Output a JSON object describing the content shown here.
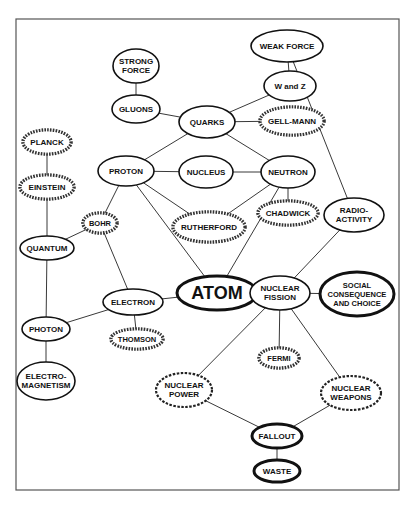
{
  "diagram": {
    "type": "concept-map",
    "central_concept": "ATOM",
    "frame": {
      "x": 16,
      "y": 19,
      "width": 383,
      "height": 471
    },
    "nodes": [
      {
        "id": "strong_force",
        "lines": [
          "STRONG",
          "FORCE"
        ],
        "cx": 136,
        "cy": 66,
        "rx": 23,
        "ry": 17,
        "style": "plain",
        "size": 8
      },
      {
        "id": "gluons",
        "lines": [
          "GLUONS"
        ],
        "cx": 136,
        "cy": 109,
        "rx": 24,
        "ry": 14,
        "style": "plain",
        "size": 8
      },
      {
        "id": "quarks",
        "lines": [
          "QUARKS"
        ],
        "cx": 207,
        "cy": 122,
        "rx": 28,
        "ry": 16,
        "style": "plain",
        "size": 8
      },
      {
        "id": "weak_force",
        "lines": [
          "WEAK FORCE"
        ],
        "cx": 287,
        "cy": 46,
        "rx": 36,
        "ry": 16,
        "style": "plain",
        "size": 8
      },
      {
        "id": "w_and_z",
        "lines": [
          "W and Z"
        ],
        "cx": 290,
        "cy": 86,
        "rx": 26,
        "ry": 15,
        "style": "plain",
        "size": 8
      },
      {
        "id": "gell_mann",
        "lines": [
          "GELL-MANN"
        ],
        "cx": 292,
        "cy": 121,
        "rx": 32,
        "ry": 14,
        "style": "striped",
        "size": 8
      },
      {
        "id": "planck",
        "lines": [
          "PLANCK"
        ],
        "cx": 47,
        "cy": 142,
        "rx": 24,
        "ry": 12,
        "style": "striped",
        "size": 8
      },
      {
        "id": "proton",
        "lines": [
          "PROTON"
        ],
        "cx": 126,
        "cy": 171,
        "rx": 28,
        "ry": 15,
        "style": "plain",
        "size": 8
      },
      {
        "id": "nucleus",
        "lines": [
          "NUCLEUS"
        ],
        "cx": 206,
        "cy": 172,
        "rx": 27,
        "ry": 16,
        "style": "plain",
        "size": 8
      },
      {
        "id": "neutron",
        "lines": [
          "NEUTRON"
        ],
        "cx": 288,
        "cy": 172,
        "rx": 27,
        "ry": 16,
        "style": "plain",
        "size": 8
      },
      {
        "id": "einstein",
        "lines": [
          "EINSTEIN"
        ],
        "cx": 47,
        "cy": 187,
        "rx": 27,
        "ry": 12,
        "style": "striped",
        "size": 8
      },
      {
        "id": "rutherford",
        "lines": [
          "RUTHERFORD"
        ],
        "cx": 209,
        "cy": 227,
        "rx": 36,
        "ry": 15,
        "style": "striped",
        "size": 8
      },
      {
        "id": "chadwick",
        "lines": [
          "CHADWICK"
        ],
        "cx": 288,
        "cy": 213,
        "rx": 30,
        "ry": 12,
        "style": "striped",
        "size": 8
      },
      {
        "id": "radioactivity",
        "lines": [
          "RADIO-",
          "ACTIVITY"
        ],
        "cx": 354,
        "cy": 215,
        "rx": 30,
        "ry": 17,
        "style": "plain",
        "size": 8
      },
      {
        "id": "bohr",
        "lines": [
          "BOHR"
        ],
        "cx": 100,
        "cy": 223,
        "rx": 17,
        "ry": 10,
        "style": "striped",
        "size": 7.5
      },
      {
        "id": "quantum",
        "lines": [
          "QUANTUM"
        ],
        "cx": 47,
        "cy": 248,
        "rx": 27,
        "ry": 12,
        "style": "plain",
        "size": 8
      },
      {
        "id": "atom",
        "lines": [
          "ATOM"
        ],
        "cx": 217,
        "cy": 293,
        "rx": 40,
        "ry": 17,
        "style": "bold",
        "size": 18
      },
      {
        "id": "nuclear_fission",
        "lines": [
          "NUCLEAR",
          "FISSION"
        ],
        "cx": 280,
        "cy": 293,
        "rx": 30,
        "ry": 17,
        "style": "plain",
        "size": 8
      },
      {
        "id": "social",
        "lines": [
          "SOCIAL",
          "CONSEQUENCE",
          "AND CHOICE"
        ],
        "cx": 357,
        "cy": 294,
        "rx": 37,
        "ry": 22,
        "style": "bold",
        "size": 7.5
      },
      {
        "id": "electron",
        "lines": [
          "ELECTRON"
        ],
        "cx": 133,
        "cy": 302,
        "rx": 30,
        "ry": 13,
        "style": "plain",
        "size": 8
      },
      {
        "id": "photon",
        "lines": [
          "PHOTON"
        ],
        "cx": 46,
        "cy": 329,
        "rx": 24,
        "ry": 12,
        "style": "plain",
        "size": 8
      },
      {
        "id": "thomson",
        "lines": [
          "THOMSON"
        ],
        "cx": 137,
        "cy": 339,
        "rx": 26,
        "ry": 10,
        "style": "striped",
        "size": 7.5
      },
      {
        "id": "fermi",
        "lines": [
          "FERMI"
        ],
        "cx": 279,
        "cy": 358,
        "rx": 20,
        "ry": 10,
        "style": "striped",
        "size": 7.5
      },
      {
        "id": "electromagnetism",
        "lines": [
          "ELECTRO-",
          "MAGNETISM"
        ],
        "cx": 46,
        "cy": 381,
        "rx": 29,
        "ry": 19,
        "style": "plain",
        "size": 8
      },
      {
        "id": "nuclear_power",
        "lines": [
          "NUCLEAR",
          "POWER"
        ],
        "cx": 184,
        "cy": 390,
        "rx": 28,
        "ry": 17,
        "style": "dashed",
        "size": 8
      },
      {
        "id": "nuclear_weapons",
        "lines": [
          "NUCLEAR",
          "WEAPONS"
        ],
        "cx": 351,
        "cy": 393,
        "rx": 30,
        "ry": 17,
        "style": "dashed",
        "size": 8
      },
      {
        "id": "fallout",
        "lines": [
          "FALLOUT"
        ],
        "cx": 277,
        "cy": 436,
        "rx": 25,
        "ry": 12,
        "style": "bold",
        "size": 8
      },
      {
        "id": "waste",
        "lines": [
          "WASTE"
        ],
        "cx": 277,
        "cy": 471,
        "rx": 23,
        "ry": 11,
        "style": "bold",
        "size": 8
      }
    ],
    "edges": [
      [
        "strong_force",
        "gluons"
      ],
      [
        "gluons",
        "quarks"
      ],
      [
        "quarks",
        "w_and_z"
      ],
      [
        "quarks",
        "gell_mann"
      ],
      [
        "quarks",
        "proton"
      ],
      [
        "quarks",
        "neutron"
      ],
      [
        "weak_force",
        "w_and_z"
      ],
      [
        "weak_force",
        "radioactivity"
      ],
      [
        "planck",
        "einstein"
      ],
      [
        "einstein",
        "quantum"
      ],
      [
        "quantum",
        "photon"
      ],
      [
        "quantum",
        "bohr"
      ],
      [
        "photon",
        "electromagnetism"
      ],
      [
        "photon",
        "electron"
      ],
      [
        "proton",
        "nucleus"
      ],
      [
        "nucleus",
        "neutron"
      ],
      [
        "proton",
        "rutherford"
      ],
      [
        "neutron",
        "rutherford"
      ],
      [
        "neutron",
        "chadwick"
      ],
      [
        "proton",
        "bohr"
      ],
      [
        "proton",
        "atom"
      ],
      [
        "neutron",
        "atom"
      ],
      [
        "bohr",
        "electron"
      ],
      [
        "electron",
        "atom"
      ],
      [
        "electron",
        "thomson"
      ],
      [
        "atom",
        "nuclear_fission"
      ],
      [
        "radioactivity",
        "nuclear_fission"
      ],
      [
        "nuclear_fission",
        "social"
      ],
      [
        "nuclear_fission",
        "fermi"
      ],
      [
        "nuclear_fission",
        "nuclear_power"
      ],
      [
        "nuclear_fission",
        "nuclear_weapons"
      ],
      [
        "nuclear_power",
        "fallout"
      ],
      [
        "nuclear_weapons",
        "fallout"
      ],
      [
        "fallout",
        "waste"
      ]
    ],
    "legend_styles": {
      "plain": "concept",
      "striped": "scientist",
      "dashed": "application",
      "bold": "central / societal issue"
    }
  }
}
